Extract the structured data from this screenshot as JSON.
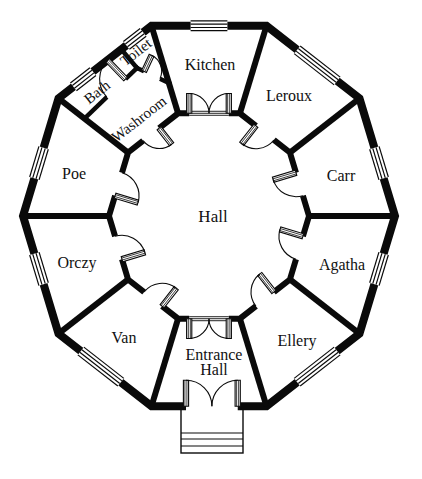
{
  "floorplan": {
    "canvas": {
      "w": 422,
      "h": 479
    },
    "colors": {
      "wall": "#0a0a0a",
      "bg": "#ffffff"
    },
    "center": {
      "x": 209,
      "y": 216
    },
    "outer": {
      "rx": 186,
      "ry": 200,
      "wall": 8
    },
    "inner": {
      "rx": 100,
      "ry": 108,
      "wall": 6
    },
    "angles": [
      108,
      72,
      36,
      0,
      -36,
      -72,
      -108,
      -144,
      180,
      144
    ],
    "rooms": [
      {
        "id": "hall",
        "name": "Hall",
        "x": 213,
        "y": 216,
        "rot": 0,
        "size": 17
      },
      {
        "id": "kitchen",
        "name": "Kitchen",
        "x": 210,
        "y": 64,
        "rot": 0,
        "size": 16
      },
      {
        "id": "leroux",
        "name": "Leroux",
        "x": 289,
        "y": 95,
        "rot": 0,
        "size": 16
      },
      {
        "id": "carr",
        "name": "Carr",
        "x": 341,
        "y": 175,
        "rot": 0,
        "size": 16
      },
      {
        "id": "agatha",
        "name": "Agatha",
        "x": 342,
        "y": 264,
        "rot": 0,
        "size": 16
      },
      {
        "id": "ellery",
        "name": "Ellery",
        "x": 297,
        "y": 340,
        "rot": 0,
        "size": 16
      },
      {
        "id": "entrance-hall",
        "name": "Entrance Hall",
        "lines": [
          "Entrance",
          "Hall"
        ],
        "x": 214,
        "y": 362,
        "rot": 0,
        "size": 16,
        "line_h": 15
      },
      {
        "id": "van",
        "name": "Van",
        "x": 124,
        "y": 337,
        "rot": 0,
        "size": 16
      },
      {
        "id": "orczy",
        "name": "Orczy",
        "x": 77,
        "y": 262,
        "rot": 0,
        "size": 16
      },
      {
        "id": "poe",
        "name": "Poe",
        "x": 74,
        "y": 173,
        "rot": 0,
        "size": 16
      },
      {
        "id": "bath",
        "name": "Bath",
        "x": 97,
        "y": 92,
        "rot": -38,
        "size": 15
      },
      {
        "id": "toilet",
        "name": "Toilet",
        "x": 136,
        "y": 52,
        "rot": -38,
        "size": 15
      },
      {
        "id": "washroom",
        "name": "Washroom",
        "x": 139,
        "y": 119,
        "rot": -38,
        "size": 15
      }
    ],
    "sub_walls": [
      {
        "id": "wall-bath-washroom",
        "p": [
          85,
          118,
          137,
          68
        ],
        "w": 4.5
      },
      {
        "id": "wall-bath-toilet",
        "p": [
          121,
          49,
          137,
          68
        ],
        "w": 4.5
      },
      {
        "id": "wall-toilet-washroom",
        "p": [
          137,
          68,
          169,
          83
        ],
        "w": 4.5
      }
    ],
    "windows": [
      {
        "id": "window-kitchen",
        "edge": 0,
        "t0": 0.34,
        "t1": 0.66
      },
      {
        "id": "window-leroux",
        "edge": 1,
        "t0": 0.33,
        "t1": 0.76
      },
      {
        "id": "window-carr",
        "edge": 2,
        "t0": 0.42,
        "t1": 0.68
      },
      {
        "id": "window-agatha",
        "edge": 3,
        "t0": 0.32,
        "t1": 0.58
      },
      {
        "id": "window-ellery",
        "edge": 4,
        "t0": 0.24,
        "t1": 0.67
      },
      {
        "id": "window-van",
        "edge": 6,
        "t0": 0.33,
        "t1": 0.76
      },
      {
        "id": "window-orczy",
        "edge": 7,
        "t0": 0.42,
        "t1": 0.68
      },
      {
        "id": "window-poe",
        "edge": 8,
        "t0": 0.32,
        "t1": 0.58
      },
      {
        "id": "window-bath",
        "edge": 9,
        "t0": 0.16,
        "t1": 0.37
      },
      {
        "id": "window-toilet",
        "edge": 9,
        "t0": 0.73,
        "t1": 0.91
      }
    ],
    "doors": [
      {
        "id": "kitchen-door",
        "kind": "double",
        "wall": "inner",
        "edge": 0,
        "t0": 0.18,
        "t1": 0.82,
        "swing": "out",
        "threshold": true
      },
      {
        "id": "hall-entrance-door",
        "kind": "double",
        "wall": "inner",
        "edge": 5,
        "t0": 0.18,
        "t1": 0.82,
        "swing": "out",
        "threshold": true
      },
      {
        "id": "front-door",
        "kind": "double",
        "wall": "outer",
        "edge": 5,
        "t0": 0.25,
        "t1": 0.7,
        "swing": "in",
        "threshold": false
      },
      {
        "id": "leroux-door",
        "kind": "single",
        "wall": "inner",
        "edge": 1,
        "t0": 0.32,
        "t1": 0.68,
        "hinge": "start",
        "swing": "in"
      },
      {
        "id": "carr-door",
        "kind": "single",
        "wall": "inner",
        "edge": 2,
        "t0": 0.32,
        "t1": 0.68,
        "hinge": "start",
        "swing": "in"
      },
      {
        "id": "agatha-door",
        "kind": "single",
        "wall": "inner",
        "edge": 3,
        "t0": 0.32,
        "t1": 0.68,
        "hinge": "start",
        "swing": "in"
      },
      {
        "id": "ellery-door",
        "kind": "single",
        "wall": "inner",
        "edge": 4,
        "t0": 0.32,
        "t1": 0.68,
        "hinge": "start",
        "swing": "in"
      },
      {
        "id": "van-door",
        "kind": "single",
        "wall": "inner",
        "edge": 6,
        "t0": 0.32,
        "t1": 0.68,
        "hinge": "start",
        "swing": "in"
      },
      {
        "id": "orczy-door",
        "kind": "single",
        "wall": "inner",
        "edge": 7,
        "t0": 0.32,
        "t1": 0.68,
        "hinge": "start",
        "swing": "in"
      },
      {
        "id": "poe-door",
        "kind": "single",
        "wall": "inner",
        "edge": 8,
        "t0": 0.32,
        "t1": 0.68,
        "hinge": "start",
        "swing": "in"
      },
      {
        "id": "washroom-door",
        "kind": "single",
        "wall": "inner",
        "edge": 9,
        "t0": 0.3,
        "t1": 0.62,
        "hinge": "end",
        "swing": "in"
      },
      {
        "id": "bath-door",
        "kind": "single",
        "wall": "seg",
        "seg": [
          85,
          118,
          137,
          68
        ],
        "t0": 0.42,
        "t1": 0.78,
        "hinge": "end",
        "swing": "left"
      },
      {
        "id": "toilet-door",
        "kind": "single",
        "wall": "seg",
        "seg": [
          137,
          68,
          169,
          83
        ],
        "t0": 0.22,
        "t1": 0.72,
        "hinge": "start",
        "swing": "left"
      }
    ],
    "steps": {
      "x": 181,
      "y": 408,
      "w": 62,
      "h": 45,
      "lines": [
        433,
        439,
        446
      ]
    }
  }
}
